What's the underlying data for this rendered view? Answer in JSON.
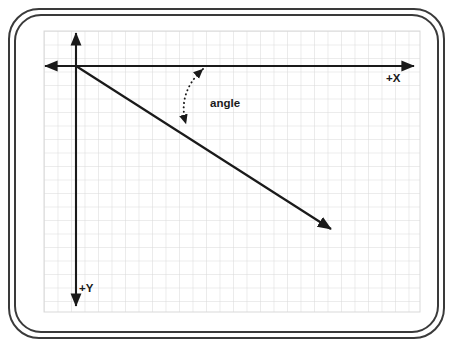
{
  "diagram": {
    "frame": {
      "outer_border_color": "#3a3a3a",
      "inner_border_color": "#3a3a3a",
      "background_color": "#ffffff"
    },
    "grid": {
      "line_color": "#d8d8d8",
      "cell_size": 13.5,
      "left": 44,
      "top": 31,
      "right": 420,
      "bottom": 312,
      "visible": true
    },
    "axes": {
      "color": "#1a1a1a",
      "origin": {
        "x": 76,
        "y": 66
      },
      "x_axis": {
        "label": "+X",
        "label_x": 386,
        "label_y": 82,
        "start_x": 45,
        "end_x": 414,
        "y": 66,
        "arrow_start": true,
        "arrow_end": true
      },
      "y_axis": {
        "label": "+Y",
        "label_x": 79,
        "label_y": 292,
        "x": 76,
        "start_y": 33,
        "end_y": 306,
        "arrow_start": true,
        "arrow_end": true
      }
    },
    "vector": {
      "name": "direction-vector",
      "color": "#1a1a1a",
      "from": {
        "x": 76,
        "y": 66
      },
      "to": {
        "x": 331,
        "y": 229
      },
      "arrow_end": true
    },
    "angle_marker": {
      "label": "angle",
      "label_x": 210,
      "label_y": 107,
      "style": "dotted-double-arrow-arc",
      "color": "#1a1a1a",
      "arc_start": {
        "x": 203,
        "y": 68
      },
      "arc_end": {
        "x": 185,
        "y": 125
      },
      "arc_control": {
        "x": 176,
        "y": 92
      },
      "arrow_start": true,
      "arrow_end": true
    }
  }
}
